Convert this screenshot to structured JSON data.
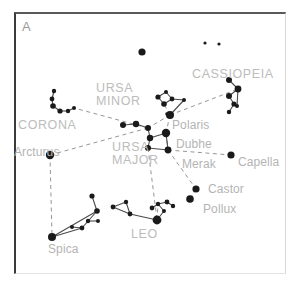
{
  "figure": {
    "panel_label": "A",
    "width": 296,
    "height": 291,
    "background": "#ffffff",
    "frame_color": "#3a3a3a",
    "star_color": "#1a1a1a",
    "line_color": "#4a4a4a",
    "dashed_line_color": "#8a8a8a",
    "label_color": "#b4b4b4"
  },
  "chart_data": {
    "type": "scatter",
    "title": "A",
    "xlabel": "",
    "ylabel": "",
    "xlim": [
      0,
      296
    ],
    "ylim": [
      0,
      291
    ],
    "grid": false,
    "legend": "none",
    "star_labels": [
      {
        "name": "Polaris",
        "x": 172,
        "y": 119,
        "anchor": "left"
      },
      {
        "name": "Dubhe",
        "x": 176,
        "y": 138,
        "anchor": "left"
      },
      {
        "name": "Merak",
        "x": 182,
        "y": 158,
        "anchor": "left"
      },
      {
        "name": "Capella",
        "x": 238,
        "y": 156,
        "anchor": "left"
      },
      {
        "name": "Castor",
        "x": 208,
        "y": 183,
        "anchor": "left"
      },
      {
        "name": "Pollux",
        "x": 203,
        "y": 203,
        "anchor": "left"
      },
      {
        "name": "Arcturus",
        "x": 14,
        "y": 146,
        "anchor": "left"
      },
      {
        "name": "Spica",
        "x": 48,
        "y": 243,
        "anchor": "left"
      }
    ],
    "constellation_labels": [
      {
        "name": "URSA MINOR",
        "lines": [
          "URSA",
          "MINOR"
        ],
        "x": 96,
        "y": 82
      },
      {
        "name": "URSA MAJOR",
        "lines": [
          "URSA",
          "MAJOR"
        ],
        "x": 112,
        "y": 141
      },
      {
        "name": "CASSIOPEIA",
        "lines": [
          "CASSIOPEIA"
        ],
        "x": 192,
        "y": 68
      },
      {
        "name": "CORONA",
        "lines": [
          "CORONA"
        ],
        "x": 18,
        "y": 119
      },
      {
        "name": "LEO",
        "lines": [
          "LEO"
        ],
        "x": 131,
        "y": 228
      }
    ],
    "stars": [
      {
        "id": "cas-a",
        "x": 205,
        "y": 43,
        "r": 1.6
      },
      {
        "id": "cas-b",
        "x": 219,
        "y": 44,
        "r": 1.6
      },
      {
        "id": "iso-1",
        "x": 142,
        "y": 52,
        "r": 3.6
      },
      {
        "id": "cas-1",
        "x": 229,
        "y": 80,
        "r": 3.0
      },
      {
        "id": "cas-2",
        "x": 238,
        "y": 89,
        "r": 3.4
      },
      {
        "id": "cas-3",
        "x": 229,
        "y": 96,
        "r": 3.0
      },
      {
        "id": "cas-4",
        "x": 234,
        "y": 104,
        "r": 2.6
      },
      {
        "id": "cas-5",
        "x": 229,
        "y": 112,
        "r": 2.2
      },
      {
        "id": "cas-6",
        "x": 237,
        "y": 106,
        "r": 2.0
      },
      {
        "id": "umi-b1",
        "x": 158,
        "y": 97,
        "r": 2.6
      },
      {
        "id": "umi-b2",
        "x": 166,
        "y": 92,
        "r": 2.0
      },
      {
        "id": "umi-b3",
        "x": 172,
        "y": 99,
        "r": 2.4
      },
      {
        "id": "umi-b4",
        "x": 164,
        "y": 104,
        "r": 2.8
      },
      {
        "id": "umi-h1",
        "x": 184,
        "y": 100,
        "r": 2.0
      },
      {
        "id": "umi-mid",
        "x": 167,
        "y": 114,
        "r": 1.8
      },
      {
        "id": "polaris",
        "x": 170,
        "y": 115,
        "r": 4.0
      },
      {
        "id": "uma-1",
        "x": 123,
        "y": 125,
        "r": 3.0
      },
      {
        "id": "uma-2",
        "x": 136,
        "y": 124,
        "r": 3.2
      },
      {
        "id": "uma-3",
        "x": 148,
        "y": 128,
        "r": 3.0
      },
      {
        "id": "dubhe",
        "x": 166,
        "y": 133,
        "r": 4.2
      },
      {
        "id": "merak",
        "x": 168,
        "y": 150,
        "r": 3.4
      },
      {
        "id": "uma-6",
        "x": 148,
        "y": 148,
        "r": 3.0
      },
      {
        "id": "uma-7",
        "x": 150,
        "y": 138,
        "r": 3.2
      },
      {
        "id": "crb-1",
        "x": 54,
        "y": 91,
        "r": 2.2
      },
      {
        "id": "crb-2",
        "x": 52,
        "y": 99,
        "r": 2.4
      },
      {
        "id": "crb-3",
        "x": 53,
        "y": 106,
        "r": 2.8
      },
      {
        "id": "crb-4",
        "x": 60,
        "y": 111,
        "r": 2.6
      },
      {
        "id": "crb-5",
        "x": 68,
        "y": 111,
        "r": 2.2
      },
      {
        "id": "crb-6",
        "x": 74,
        "y": 108,
        "r": 2.0
      },
      {
        "id": "arcturus",
        "x": 50,
        "y": 155,
        "r": 4.2
      },
      {
        "id": "capella",
        "x": 231,
        "y": 155,
        "r": 3.6
      },
      {
        "id": "castor",
        "x": 196,
        "y": 189,
        "r": 3.6
      },
      {
        "id": "pollux",
        "x": 190,
        "y": 199,
        "r": 3.8
      },
      {
        "id": "leo-reg",
        "x": 157,
        "y": 220,
        "r": 4.4
      },
      {
        "id": "leo-1",
        "x": 152,
        "y": 208,
        "r": 2.4
      },
      {
        "id": "leo-2",
        "x": 158,
        "y": 204,
        "r": 2.2
      },
      {
        "id": "leo-3",
        "x": 167,
        "y": 202,
        "r": 2.4
      },
      {
        "id": "leo-4",
        "x": 173,
        "y": 206,
        "r": 2.2
      },
      {
        "id": "leo-5",
        "x": 164,
        "y": 211,
        "r": 2.0
      },
      {
        "id": "leo-6",
        "x": 130,
        "y": 214,
        "r": 2.4
      },
      {
        "id": "leo-7",
        "x": 113,
        "y": 207,
        "r": 2.4
      },
      {
        "id": "leo-8",
        "x": 126,
        "y": 202,
        "r": 2.2
      },
      {
        "id": "leo-9",
        "x": 98,
        "y": 221,
        "r": 2.0
      },
      {
        "id": "leo-10",
        "x": 88,
        "y": 221,
        "r": 2.2
      },
      {
        "id": "vir-1",
        "x": 97,
        "y": 211,
        "r": 2.8
      },
      {
        "id": "vir-2",
        "x": 92,
        "y": 196,
        "r": 2.6
      },
      {
        "id": "vir-3",
        "x": 82,
        "y": 228,
        "r": 2.4
      },
      {
        "id": "vir-4",
        "x": 72,
        "y": 227,
        "r": 2.0
      },
      {
        "id": "spica",
        "x": 52,
        "y": 237,
        "r": 4.0
      }
    ],
    "solid_lines": [
      [
        "cas-1",
        "cas-2"
      ],
      [
        "cas-2",
        "cas-3"
      ],
      [
        "cas-3",
        "cas-4"
      ],
      [
        "cas-4",
        "cas-5"
      ],
      [
        "cas-2",
        "cas-6"
      ],
      [
        "umi-b1",
        "umi-b2"
      ],
      [
        "umi-b2",
        "umi-b3"
      ],
      [
        "umi-b3",
        "umi-b4"
      ],
      [
        "umi-b4",
        "umi-b1"
      ],
      [
        "umi-b3",
        "umi-h1"
      ],
      [
        "umi-h1",
        "polaris"
      ],
      [
        "uma-1",
        "uma-2"
      ],
      [
        "uma-2",
        "uma-3"
      ],
      [
        "uma-3",
        "uma-7"
      ],
      [
        "uma-7",
        "dubhe"
      ],
      [
        "dubhe",
        "merak"
      ],
      [
        "merak",
        "uma-6"
      ],
      [
        "uma-6",
        "uma-7"
      ],
      [
        "crb-1",
        "crb-2"
      ],
      [
        "crb-2",
        "crb-3"
      ],
      [
        "crb-3",
        "crb-4"
      ],
      [
        "crb-4",
        "crb-5"
      ],
      [
        "crb-5",
        "crb-6"
      ],
      [
        "leo-reg",
        "leo-5"
      ],
      [
        "leo-5",
        "leo-2"
      ],
      [
        "leo-2",
        "leo-1"
      ],
      [
        "leo-2",
        "leo-3"
      ],
      [
        "leo-3",
        "leo-4"
      ],
      [
        "leo-reg",
        "leo-6"
      ],
      [
        "leo-6",
        "leo-7"
      ],
      [
        "leo-7",
        "leo-8"
      ],
      [
        "leo-8",
        "leo-6"
      ],
      [
        "leo-9",
        "leo-10"
      ],
      [
        "vir-1",
        "vir-2"
      ],
      [
        "vir-1",
        "vir-3"
      ],
      [
        "vir-3",
        "vir-4"
      ],
      [
        "vir-1",
        "spica"
      ],
      [
        "vir-3",
        "spica"
      ]
    ],
    "dashed_lines": [
      [
        "polaris",
        "cas-2"
      ],
      [
        "polaris",
        "umi-b4"
      ],
      [
        "polaris",
        "uma-3"
      ],
      [
        "polaris",
        "dubhe"
      ],
      [
        "dubhe",
        "merak"
      ],
      [
        "merak",
        "capella"
      ],
      [
        "merak",
        "castor"
      ],
      [
        "castor",
        "pollux"
      ],
      [
        "uma-3",
        "crb-6"
      ],
      [
        "uma-3",
        "arcturus"
      ],
      [
        "arcturus",
        "spica"
      ],
      [
        "uma-6",
        "leo-reg"
      ],
      [
        "leo-reg",
        "leo-2"
      ]
    ]
  }
}
